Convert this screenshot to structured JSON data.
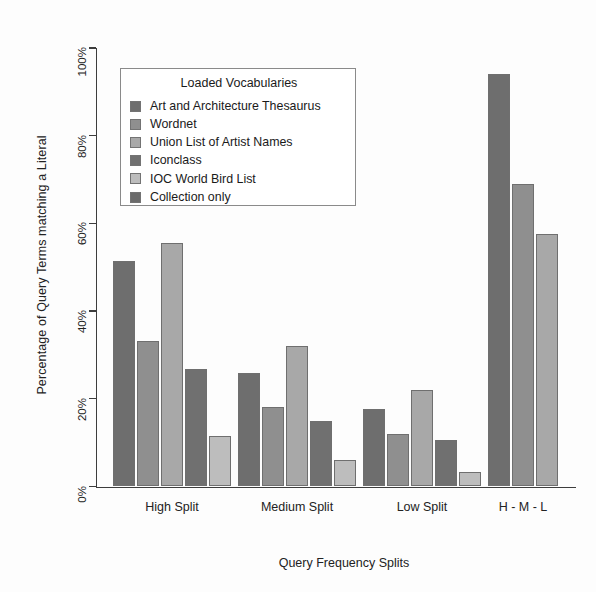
{
  "chart_data": {
    "type": "bar",
    "title": "",
    "xlabel": "Query Frequency Splits",
    "ylabel": "Percentage of Query Terms matching a Literal",
    "ylim": [
      0,
      100
    ],
    "yticks": [
      "0%",
      "20%",
      "40%",
      "60%",
      "80%",
      "100%"
    ],
    "ytick_values": [
      0,
      20,
      40,
      60,
      80,
      100
    ],
    "grid": false,
    "legend_position": "upper-left-inside",
    "legend_title": "Loaded Vocabularies",
    "categories": [
      "High Split",
      "Medium Split",
      "Low Split",
      "H - M - L"
    ],
    "series": [
      {
        "name": "Art and Architecture Thesaurus",
        "color": "#6e6e6e",
        "values": [
          51.5,
          25.8,
          17.6,
          94.0
        ]
      },
      {
        "name": "Wordnet",
        "color": "#8f8f8f",
        "values": [
          33.2,
          18.1,
          12.0,
          69.0
        ]
      },
      {
        "name": "Union List of Artist Names",
        "color": "#a8a8a8",
        "values": [
          55.6,
          32.0,
          21.9,
          57.5
        ]
      },
      {
        "name": "Iconclass",
        "color": "#707070",
        "values": [
          26.9,
          15.0,
          10.6,
          null
        ]
      },
      {
        "name": "IOC World Bird List",
        "color": "#bdbdbd",
        "values": [
          11.6,
          6.1,
          3.2,
          null
        ]
      },
      {
        "name": "Collection only",
        "color": "#6b6b6b",
        "values": [
          null,
          null,
          null,
          null
        ]
      }
    ]
  },
  "axis": {
    "y_title": "Percentage of Query Terms matching a Literal",
    "x_title": "Query Frequency Splits"
  },
  "legend": {
    "title": "Loaded Vocabularies",
    "items": [
      {
        "label": "Art and Architecture Thesaurus",
        "color": "#6e6e6e"
      },
      {
        "label": "Wordnet",
        "color": "#8f8f8f"
      },
      {
        "label": "Union List of Artist Names",
        "color": "#a8a8a8"
      },
      {
        "label": "Iconclass",
        "color": "#707070"
      },
      {
        "label": "IOC World Bird List",
        "color": "#bdbdbd"
      },
      {
        "label": "Collection only",
        "color": "#6b6b6b"
      }
    ]
  },
  "geometry": {
    "plot_left": 96,
    "plot_right": 576,
    "baseline_y": 486.5,
    "top_y": 48,
    "bar_width": 22,
    "bar_gap": 2,
    "group_gap": 26,
    "group_starts": [
      113,
      238,
      363,
      488
    ]
  }
}
